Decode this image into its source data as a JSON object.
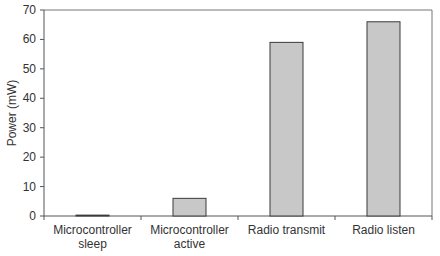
{
  "chart_data": {
    "type": "bar",
    "title": "",
    "xlabel": "",
    "ylabel": "Power (mW)",
    "categories": [
      "Microcontroller sleep",
      "Microcontroller active",
      "Radio transmit",
      "Radio listen"
    ],
    "category_lines": [
      [
        "Microcontroller",
        "sleep"
      ],
      [
        "Microcontroller",
        "active"
      ],
      [
        "Radio transmit"
      ],
      [
        "Radio listen"
      ]
    ],
    "values": [
      0.3,
      6,
      59,
      66
    ],
    "ylim": [
      0,
      70
    ],
    "yticks": [
      0,
      10,
      20,
      30,
      40,
      50,
      60,
      70
    ],
    "grid": false,
    "legend": null,
    "colors": {
      "bar_fill": "#c8c8c8",
      "bar_stroke": "#3a3a3a",
      "axis": "#555555"
    }
  }
}
